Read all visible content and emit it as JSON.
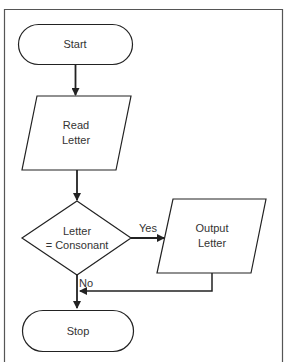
{
  "diagram": {
    "type": "flowchart",
    "colors": {
      "stroke": "#222222",
      "frame": "#555555",
      "text": "#333333",
      "background": "#ffffff"
    },
    "nodes": [
      {
        "id": "start",
        "shape": "terminal",
        "label": "Start"
      },
      {
        "id": "read",
        "shape": "parallelogram",
        "label_lines": [
          "Read",
          "Letter"
        ]
      },
      {
        "id": "decision",
        "shape": "diamond",
        "label_lines": [
          "Letter",
          "= Consonant"
        ]
      },
      {
        "id": "output",
        "shape": "parallelogram",
        "label_lines": [
          "Output",
          "Letter"
        ]
      },
      {
        "id": "stop",
        "shape": "terminal",
        "label": "Stop"
      }
    ],
    "edges": [
      {
        "from": "start",
        "to": "read",
        "label": ""
      },
      {
        "from": "read",
        "to": "decision",
        "label": ""
      },
      {
        "from": "decision",
        "to": "output",
        "label": "Yes"
      },
      {
        "from": "decision",
        "to": "stop",
        "label": "No"
      },
      {
        "from": "output",
        "to": "stop",
        "label": ""
      }
    ]
  },
  "labels": {
    "start": "Start",
    "read_line1": "Read",
    "read_line2": "Letter",
    "decision_line1": "Letter",
    "decision_line2": "= Consonant",
    "output_line1": "Output",
    "output_line2": "Letter",
    "stop": "Stop",
    "yes": "Yes",
    "no": "No"
  }
}
